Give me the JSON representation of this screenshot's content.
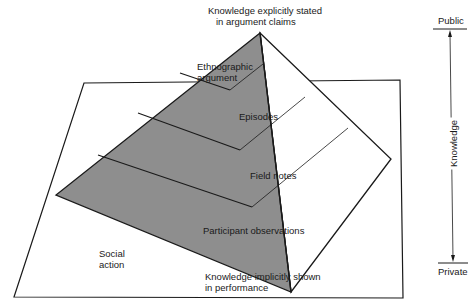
{
  "diagram": {
    "type": "pyramid-on-plane",
    "top_label": [
      "Knowledge explicitly stated",
      "in argument claims"
    ],
    "bottom_label": [
      "Knowledge implicitly shown",
      "in performance"
    ],
    "plane_label": [
      "Social",
      "action"
    ],
    "levels": [
      {
        "label": "Ethnographic argument",
        "lines": [
          "Ethnographic",
          "argument"
        ]
      },
      {
        "label": "Episodes",
        "lines": [
          "Episodes"
        ]
      },
      {
        "label": "Field notes",
        "lines": [
          "Field notes"
        ]
      },
      {
        "label": "Participant observations",
        "lines": [
          "Participant observations"
        ]
      }
    ],
    "scale": {
      "axis_label": "Knowledge",
      "top": "Public",
      "bottom": "Private"
    },
    "colors": {
      "shaded_face": "#8c8c8c",
      "line": "#1a1a1a",
      "background": "#ffffff"
    }
  }
}
